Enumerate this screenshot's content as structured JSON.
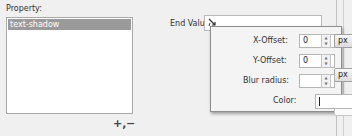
{
  "property": {
    "label": "Property:",
    "items": [
      {
        "label": "text-shadow",
        "selected": true
      }
    ],
    "add_label": "+,",
    "remove_label": "−"
  },
  "end_value": {
    "label": "End Value:",
    "icon": "shadow-tool-icon",
    "value": ""
  },
  "shadow_popup": {
    "x_offset": {
      "label": "X-Offset:",
      "value": "0",
      "unit": "px"
    },
    "y_offset": {
      "label": "Y-Offset:",
      "value": "0",
      "unit": "px"
    },
    "blur_radius": {
      "label": "Blur radius:",
      "value": "",
      "unit": ""
    },
    "color": {
      "label": "Color:",
      "value": ""
    }
  },
  "colors": {
    "selection": "#9a9a9a",
    "background": "#f0f0f0",
    "popup_background": "#f4f4f4"
  }
}
